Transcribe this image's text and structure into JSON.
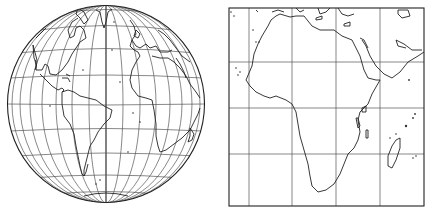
{
  "figure": {
    "panels": [
      {
        "id": "globe",
        "projection": "orthographic",
        "region": "Atlantic hemisphere (Americas, Europe, Africa)",
        "graticule": true
      },
      {
        "id": "square",
        "projection": "rectangular grid",
        "region": "Africa and Arabian Peninsula",
        "graticule": true,
        "grid_columns": 5,
        "grid_rows": 4
      }
    ],
    "colors": {
      "background": "#ffffff",
      "line": "#222222"
    }
  }
}
